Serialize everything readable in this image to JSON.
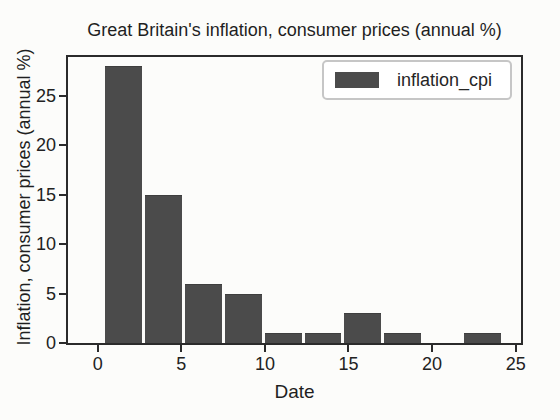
{
  "title": "Great Britain's inflation, consumer prices (annual %)",
  "legend": {
    "label": "inflation_cpi",
    "swatch_color": "#4b4b4b",
    "position": "upper right"
  },
  "axes": {
    "x": {
      "label": "Date",
      "ticks": [
        "0",
        "5",
        "10",
        "15",
        "20",
        "25"
      ],
      "tick_values": [
        0,
        5,
        10,
        15,
        20,
        25
      ]
    },
    "y": {
      "label": "Inflation, consumer prices (annual %)",
      "ticks": [
        "0",
        "5",
        "10",
        "15",
        "20",
        "25"
      ],
      "tick_values": [
        0,
        5,
        10,
        15,
        20,
        25
      ]
    }
  },
  "colors": {
    "bar": "#4b4b4b",
    "spine": "#2b2b2b",
    "text": "#1f1f1f",
    "background": "#fcfcfa",
    "legend_border": "#c6c6c6"
  },
  "chart_data": {
    "type": "bar",
    "subtype": "histogram",
    "title": "Great Britain's inflation, consumer prices (annual %)",
    "xlabel": "Date",
    "ylabel": "Inflation, consumer prices (annual %)",
    "legend_entries": [
      "inflation_cpi"
    ],
    "legend_position": "upper right",
    "grid": false,
    "bin_edges": [
      0.37,
      2.75,
      5.14,
      7.52,
      9.91,
      12.29,
      14.67,
      17.06,
      19.44,
      21.83,
      24.21
    ],
    "counts": [
      28,
      15,
      6,
      5,
      1,
      1,
      3,
      1,
      0,
      1
    ],
    "xlim": [
      -1.78,
      25.32
    ],
    "ylim": [
      0,
      28.9
    ],
    "bar_color": "#4b4b4b"
  }
}
